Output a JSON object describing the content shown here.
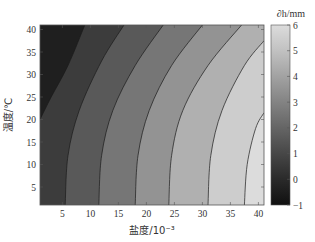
{
  "chart_data": {
    "type": "heatmap",
    "subtype": "filled-contour",
    "title": "",
    "xlabel": "盐度/10⁻³",
    "ylabel": "温度/℃",
    "colorbar_label": "∂h/mm",
    "xlim": [
      1,
      41
    ],
    "ylim": [
      1,
      41
    ],
    "x_ticks": [
      5,
      10,
      15,
      20,
      25,
      30,
      35,
      40
    ],
    "y_ticks": [
      5,
      10,
      15,
      20,
      25,
      30,
      35,
      40
    ],
    "colorbar_range": [
      -1,
      6
    ],
    "colorbar_ticks": [
      -1,
      0,
      1,
      2,
      3,
      4,
      5,
      6
    ],
    "contour_levels": [
      0,
      1,
      2,
      3,
      4,
      5
    ],
    "colormap": "gray",
    "contours": [
      {
        "level": 0,
        "points": [
          [
            1,
            20
          ],
          [
            3,
            25
          ],
          [
            6,
            32
          ],
          [
            9,
            41
          ]
        ]
      },
      {
        "level": 1,
        "points": [
          [
            5.5,
            1
          ],
          [
            6,
            12
          ],
          [
            8,
            22
          ],
          [
            12,
            33
          ],
          [
            16,
            41
          ]
        ]
      },
      {
        "level": 2,
        "points": [
          [
            11.5,
            1
          ],
          [
            12,
            12
          ],
          [
            14,
            22
          ],
          [
            18,
            32
          ],
          [
            23,
            41
          ]
        ]
      },
      {
        "level": 3,
        "points": [
          [
            18,
            1
          ],
          [
            18.5,
            12
          ],
          [
            20.5,
            22
          ],
          [
            24.5,
            32
          ],
          [
            30,
            41
          ]
        ]
      },
      {
        "level": 4,
        "points": [
          [
            24,
            1
          ],
          [
            24.5,
            12
          ],
          [
            26.5,
            22
          ],
          [
            31,
            32
          ],
          [
            37,
            41
          ]
        ]
      },
      {
        "level": 5,
        "points": [
          [
            31,
            1
          ],
          [
            31.5,
            12
          ],
          [
            33.5,
            22
          ],
          [
            37.5,
            32
          ],
          [
            41,
            37.5
          ]
        ]
      },
      {
        "level": 6,
        "points": [
          [
            37.5,
            1
          ],
          [
            38,
            10
          ],
          [
            39.5,
            18
          ],
          [
            41,
            21.5
          ]
        ]
      }
    ],
    "grid": false
  },
  "caption_text": "图  ·  ·  ·  ·  ·  ·  ·  ·  ·"
}
